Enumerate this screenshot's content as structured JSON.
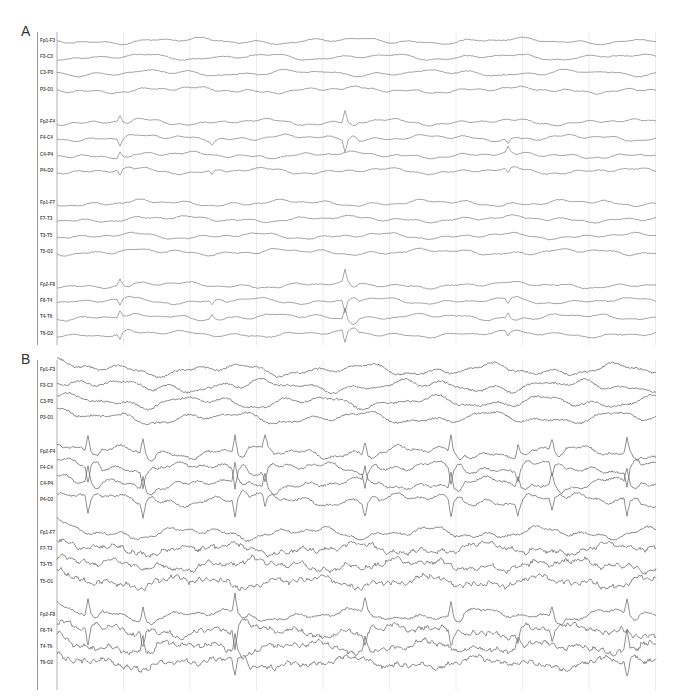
{
  "figure": {
    "width": 677,
    "height": 699,
    "trace_color": "#6a6a6a",
    "grid_color": "#e6e6e6",
    "grid_start_color": "#c8c8c8",
    "signal_x_start": 57,
    "signal_x_end": 656,
    "grid_spacing": 66.5
  },
  "panels": [
    {
      "letter": "A",
      "letter_y": 30,
      "border_top": 32,
      "border_bottom": 345,
      "amplitude": 2.2,
      "noise": 0.6,
      "channels": [
        {
          "label": "Fp1-F3",
          "y": 41
        },
        {
          "label": "F3-C3",
          "y": 57
        },
        {
          "label": "C3-P3",
          "y": 73
        },
        {
          "label": "P3-O1",
          "y": 90
        },
        {
          "label": "Fp2-F4",
          "y": 122
        },
        {
          "label": "F4-C4",
          "y": 138
        },
        {
          "label": "C4-P4",
          "y": 155
        },
        {
          "label": "P4-O2",
          "y": 171
        },
        {
          "label": "Fp1-F7",
          "y": 203
        },
        {
          "label": "F7-T3",
          "y": 219
        },
        {
          "label": "T3-T5",
          "y": 236
        },
        {
          "label": "T5-O1",
          "y": 252
        },
        {
          "label": "Fp2-F8",
          "y": 285
        },
        {
          "label": "F8-T4",
          "y": 301
        },
        {
          "label": "T4-T6",
          "y": 317
        },
        {
          "label": "T6-O2",
          "y": 334
        }
      ],
      "spikes": [
        {
          "x": 120,
          "rows": [
            4,
            5,
            6,
            7,
            12,
            13,
            14,
            15
          ],
          "amp": 6
        },
        {
          "x": 212,
          "rows": [
            5,
            7,
            13,
            14
          ],
          "amp": 4
        },
        {
          "x": 345,
          "rows": [
            4,
            5,
            12,
            13,
            14,
            15
          ],
          "amp": 12
        },
        {
          "x": 508,
          "rows": [
            5,
            6,
            7,
            13,
            14,
            15
          ],
          "amp": 5
        }
      ]
    },
    {
      "letter": "B",
      "letter_y": 358,
      "border_top": 360,
      "border_bottom": 690,
      "amplitude": 4.2,
      "noise": 1.4,
      "channels": [
        {
          "label": "Fp1-F3",
          "y": 370
        },
        {
          "label": "F3-C3",
          "y": 386
        },
        {
          "label": "C3-P3",
          "y": 402
        },
        {
          "label": "P3-O1",
          "y": 418
        },
        {
          "label": "Fp2-F4",
          "y": 452
        },
        {
          "label": "F4-C4",
          "y": 468
        },
        {
          "label": "C4-P4",
          "y": 484
        },
        {
          "label": "P4-O2",
          "y": 500
        },
        {
          "label": "Fp1-F7",
          "y": 533
        },
        {
          "label": "F7-T3",
          "y": 549
        },
        {
          "label": "T3-T5",
          "y": 565
        },
        {
          "label": "T5-O1",
          "y": 582
        },
        {
          "label": "Fp2-F8",
          "y": 615
        },
        {
          "label": "F8-T4",
          "y": 631
        },
        {
          "label": "T4-T6",
          "y": 647
        },
        {
          "label": "T6-O2",
          "y": 663
        }
      ],
      "spikes": [
        {
          "x": 88,
          "rows": [
            4,
            5,
            6,
            7,
            12,
            13
          ],
          "amp": 16
        },
        {
          "x": 143,
          "rows": [
            4,
            5,
            6,
            7,
            12,
            13,
            14
          ],
          "amp": 14
        },
        {
          "x": 235,
          "rows": [
            4,
            5,
            6,
            7,
            12,
            13,
            14,
            15
          ],
          "amp": 18
        },
        {
          "x": 265,
          "rows": [
            4,
            5,
            6,
            7
          ],
          "amp": 12
        },
        {
          "x": 365,
          "rows": [
            4,
            5,
            6,
            7,
            12,
            13,
            14
          ],
          "amp": 13
        },
        {
          "x": 451,
          "rows": [
            4,
            5,
            6,
            7,
            12,
            13
          ],
          "amp": 16
        },
        {
          "x": 518,
          "rows": [
            4,
            5,
            6,
            7,
            13,
            14
          ],
          "amp": 11
        },
        {
          "x": 552,
          "rows": [
            4,
            5,
            6,
            7,
            12,
            13
          ],
          "amp": 12
        },
        {
          "x": 627,
          "rows": [
            4,
            5,
            6,
            7,
            12,
            14,
            15
          ],
          "amp": 15
        }
      ],
      "noisy_rows": [
        9,
        10,
        11,
        13,
        14,
        15
      ]
    }
  ]
}
